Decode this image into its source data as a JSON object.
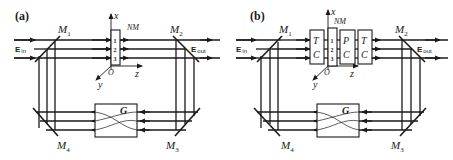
{
  "figure": {
    "panels": [
      {
        "id": "a",
        "panel_label": "(a)",
        "mirrors": [
          "M1",
          "M2",
          "M3",
          "M4"
        ],
        "mirror_labels": {
          "m1_base": "M",
          "m1_sub": "1",
          "m2_base": "M",
          "m2_sub": "2",
          "m3_base": "M",
          "m3_sub": "3",
          "m4_base": "M",
          "m4_sub": "4"
        },
        "input_label": {
          "base": "E",
          "sub": "in"
        },
        "output_label": {
          "base": "E",
          "sub": "out"
        },
        "medium_label": "NM",
        "medium_channels": [
          "1",
          "2",
          "3"
        ],
        "axes": {
          "x": "x",
          "y": "y",
          "z": "z",
          "origin": "O"
        },
        "element_g": "G",
        "components": []
      },
      {
        "id": "b",
        "panel_label": "(b)",
        "mirrors": [
          "M1",
          "M2",
          "M3",
          "M4"
        ],
        "mirror_labels": {
          "m1_base": "M",
          "m1_sub": "1",
          "m2_base": "M",
          "m2_sub": "2",
          "m3_base": "M",
          "m3_sub": "3",
          "m4_base": "M",
          "m4_sub": "4"
        },
        "input_label": {
          "base": "E",
          "sub": "in"
        },
        "output_label": {
          "base": "E",
          "sub": "out"
        },
        "medium_label": "NM",
        "medium_channels": [
          "1",
          "2",
          "3"
        ],
        "axes": {
          "x": "x",
          "y": "y",
          "z": "z",
          "origin": "O"
        },
        "element_g": "G",
        "components": [
          {
            "top": "T",
            "bottom": "C"
          },
          {
            "top": "P",
            "bottom": "C"
          },
          {
            "top": "T",
            "bottom": "C"
          }
        ]
      }
    ]
  }
}
